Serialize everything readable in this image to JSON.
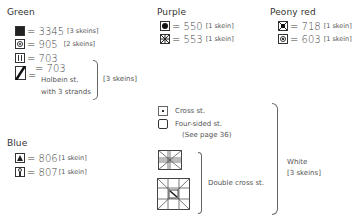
{
  "groups": {
    "green": {
      "title": "Green",
      "items": [
        {
          "symbol": "filled-square-icon",
          "eq": "= 3345",
          "skein": "[3 skeins]"
        },
        {
          "symbol": "dot-in-circle-icon",
          "eq": "= 905",
          "skein": "[2 skeins]"
        },
        {
          "symbol": "double-bar-icon",
          "eq": "= 703",
          "skein": ""
        },
        {
          "symbol": "diagonal-holbein-icon",
          "eq": "= 703",
          "note1": "Holbein st.",
          "note2": "with 3 strands"
        }
      ],
      "group_skein": "[3 skeins]"
    },
    "blue": {
      "title": "Blue",
      "items": [
        {
          "symbol": "triangle-icon",
          "eq": "= 806",
          "skein": "[1 skein]"
        },
        {
          "symbol": "figure-icon",
          "eq": "= 807",
          "skein": "[1 skein]"
        }
      ]
    },
    "purple": {
      "title": "Purple",
      "items": [
        {
          "symbol": "filled-circle-icon",
          "eq": "= 550",
          "skein": "[1 skein]"
        },
        {
          "symbol": "star-cross-icon",
          "eq": "= 553",
          "skein": "[1 skein]"
        }
      ]
    },
    "peony": {
      "title": "Peony red",
      "items": [
        {
          "symbol": "x-box-icon",
          "eq": "= 718",
          "skein": "[1 skein]"
        },
        {
          "symbol": "small-dot-icon",
          "eq": "= 603",
          "skein": "[1 skein]"
        }
      ]
    },
    "white": {
      "items": [
        {
          "symbol": "cross-stitch-icon",
          "label": "Cross st."
        },
        {
          "symbol": "four-sided-icon",
          "label": "Four-sided st.",
          "sub": "(See page 36)"
        }
      ],
      "double_label": "Double cross st.",
      "color_label": "White",
      "skein": "[3 skeins]"
    }
  }
}
